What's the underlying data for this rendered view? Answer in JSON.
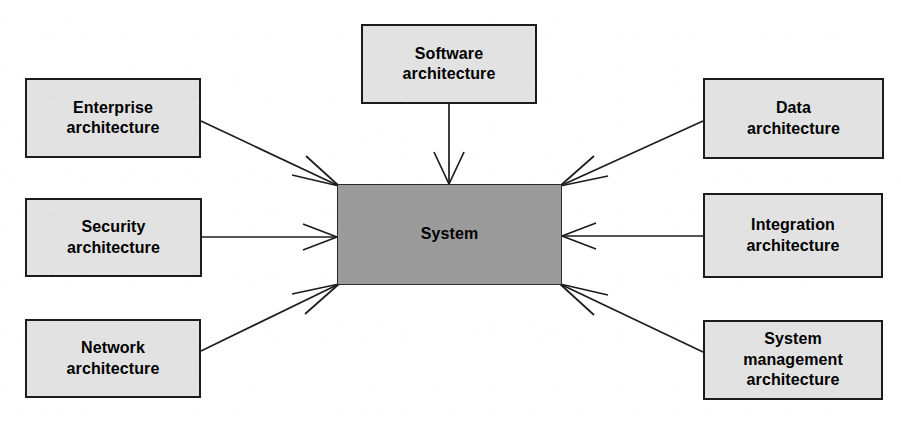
{
  "diagram": {
    "type": "hub-and-spoke",
    "colors": {
      "background": "#ffffff",
      "node_fill": "#e2e2e2",
      "center_fill": "#9b9b9b",
      "stroke": "#1c1c1c",
      "text": "#000000"
    },
    "center": {
      "id": "system",
      "label": "System",
      "x": 337,
      "y": 184,
      "width": 225,
      "height": 101
    },
    "nodes": [
      {
        "id": "enterprise-architecture",
        "label": "Enterprise\narchitecture",
        "x": 25,
        "y": 78,
        "width": 176,
        "height": 80,
        "side": "left-top"
      },
      {
        "id": "security-architecture",
        "label": "Security\narchitecture",
        "x": 25,
        "y": 198,
        "width": 177,
        "height": 79,
        "side": "left-middle"
      },
      {
        "id": "network-architecture",
        "label": "Network\narchitecture",
        "x": 25,
        "y": 319,
        "width": 176,
        "height": 79,
        "side": "left-bottom"
      },
      {
        "id": "software-architecture",
        "label": "Software\narchitecture",
        "x": 361,
        "y": 24,
        "width": 176,
        "height": 80,
        "side": "top"
      },
      {
        "id": "data-architecture",
        "label": "Data\narchitecture",
        "x": 703,
        "y": 78,
        "width": 181,
        "height": 81,
        "side": "right-top"
      },
      {
        "id": "integration-architecture",
        "label": "Integration\narchitecture",
        "x": 703,
        "y": 193,
        "width": 180,
        "height": 85,
        "side": "right-middle"
      },
      {
        "id": "system-management-architecture",
        "label": "System\nmanagement\narchitecture",
        "x": 703,
        "y": 320,
        "width": 180,
        "height": 80,
        "side": "right-bottom"
      }
    ],
    "edges": [
      {
        "id": "edge-enterprise-to-system",
        "from": "enterprise-architecture",
        "to": "system",
        "arrow": "to"
      },
      {
        "id": "edge-security-to-system",
        "from": "security-architecture",
        "to": "system",
        "arrow": "to"
      },
      {
        "id": "edge-network-to-system",
        "from": "network-architecture",
        "to": "system",
        "arrow": "to"
      },
      {
        "id": "edge-software-to-system",
        "from": "software-architecture",
        "to": "system",
        "arrow": "to"
      },
      {
        "id": "edge-data-to-system",
        "from": "data-architecture",
        "to": "system",
        "arrow": "to"
      },
      {
        "id": "edge-integration-to-system",
        "from": "integration-architecture",
        "to": "system",
        "arrow": "to"
      },
      {
        "id": "edge-system-management-to-system",
        "from": "system-management-architecture",
        "to": "system",
        "arrow": "to"
      }
    ]
  }
}
